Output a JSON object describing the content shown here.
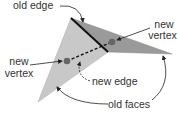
{
  "labels": {
    "old_edge": "old edge",
    "new_vertex_right_1": "new",
    "new_vertex_right_2": "vertex",
    "new_vertex_left_1": "new",
    "new_vertex_left_2": "vertex",
    "new_edge": "new edge",
    "old_faces": "old faces"
  },
  "colors": {
    "light_face": "#c8c8c8",
    "dark_face": "#9a9a9a",
    "edge": "#111111",
    "vertex": "#666666"
  }
}
